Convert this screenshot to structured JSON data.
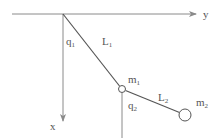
{
  "diagram": {
    "axes": {
      "x_label": "x",
      "y_label": "y"
    },
    "angles": [
      {
        "name": "q",
        "sub": "1"
      },
      {
        "name": "q",
        "sub": "2"
      }
    ],
    "links": [
      {
        "name": "L",
        "sub": "1"
      },
      {
        "name": "L",
        "sub": "2"
      }
    ],
    "masses": [
      {
        "name": "m",
        "sub": "1"
      },
      {
        "name": "m",
        "sub": "2"
      }
    ],
    "colors": {
      "line": "#8a8a8a",
      "text": "#555555"
    }
  }
}
